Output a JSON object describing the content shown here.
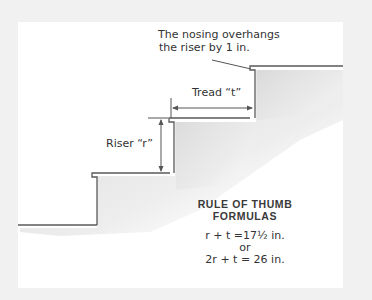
{
  "diagram": {
    "colors": {
      "background": "#f1f1f1",
      "card": "#ffffff",
      "line": "#555555",
      "text": "#333333",
      "shading": "#d9d9d9"
    },
    "annotations": {
      "nosing_note_line1": "The nosing overhangs",
      "nosing_note_line2": "the riser by 1 in.",
      "tread_label": "Tread “t”",
      "riser_label": "Riser “r”"
    },
    "formulas": {
      "title_line1": "RULE OF THUMB",
      "title_line2": "FORMULAS",
      "formula1": "r + t =17½ in.",
      "separator": "or",
      "formula2": "2r + t = 26 in."
    },
    "steps": [
      {
        "name": "floor",
        "y": 225
      },
      {
        "name": "step-1",
        "tread_y": 173,
        "riser_x": 97
      },
      {
        "name": "step-2",
        "tread_y": 118,
        "riser_x": 174
      },
      {
        "name": "step-3",
        "tread_y": 66,
        "riser_x": 255
      }
    ]
  }
}
